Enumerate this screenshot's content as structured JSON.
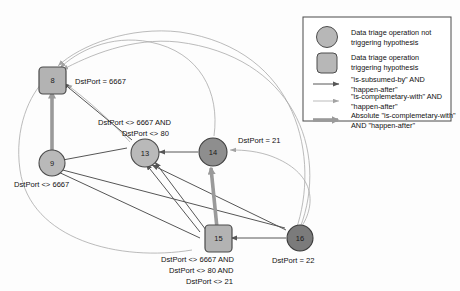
{
  "diagram": {
    "nodes": [
      {
        "id": "8",
        "shape": "square",
        "label": "8",
        "condition": "DstPort = 6667",
        "fill": "#b3b3b3"
      },
      {
        "id": "9",
        "shape": "circle",
        "label": "9",
        "condition": "DstPort <> 6667",
        "fill": "#b9b9b9"
      },
      {
        "id": "13",
        "shape": "circle",
        "label": "13",
        "condition": "DstPort <> 6667 AND\nDstPort <>  80",
        "fill": "#b9b9b9"
      },
      {
        "id": "14",
        "shape": "circle",
        "label": "14",
        "condition": "DstPort = 21",
        "fill": "#8e8e8e"
      },
      {
        "id": "15",
        "shape": "square",
        "label": "15",
        "condition": "DstPort <> 6667 AND\nDstPort <>  80 AND\nDstPort <> 21",
        "fill": "#b3b3b3"
      },
      {
        "id": "16",
        "shape": "circle",
        "label": "16",
        "condition": "DstPort = 22",
        "fill": "#7b7b7b"
      }
    ],
    "conditions": {
      "n8": "DstPort = 6667",
      "n9": "DstPort <> 6667",
      "n13_line1": "DstPort <> 6667 AND",
      "n13_line2": "DstPort <>  80",
      "n14": "DstPort = 21",
      "n15_line1": "DstPort <> 6667 AND",
      "n15_line2": "DstPort <>  80 AND",
      "n15_line3": "DstPort <> 21",
      "n16": "DstPort = 22"
    },
    "node_labels": {
      "n8": "8",
      "n9": "9",
      "n13": "13",
      "n14": "14",
      "n15": "15",
      "n16": "16"
    }
  },
  "legend": {
    "items": [
      {
        "symbol": "circle",
        "line1": "Data triage operation not",
        "line2": "triggering hypothesis"
      },
      {
        "symbol": "square",
        "line1": "Data triage operation",
        "line2": "triggering hypothesis"
      },
      {
        "symbol": "arrow-dark",
        "line1": "\"is-subsumed-by\" AND",
        "line2": "\"happen-after\""
      },
      {
        "symbol": "arrow-light",
        "line1": "\"is-complemetary-with\" AND",
        "line2": "\"happen-after\""
      },
      {
        "symbol": "arrow-thick",
        "line1": "Absolute \"is-complemetary-with\"",
        "line2": "AND \"happen-after\""
      }
    ],
    "l1a": "Data triage operation not",
    "l1b": "triggering hypothesis",
    "l2a": "Data triage operation",
    "l2b": "triggering hypothesis",
    "l3a": "\"is-subsumed-by\" AND",
    "l3b": "\"happen-after\"",
    "l4a": "\"is-complemetary-with\" AND",
    "l4b": "\"happen-after\"",
    "l5a": "Absolute \"is-complemetary-with\"",
    "l5b": "AND \"happen-after\""
  },
  "colors": {
    "edge_dark": "#565656",
    "edge_light": "#a9a9a9",
    "edge_thick": "#9a9a9a",
    "node_light": "#b9b9b9",
    "node_dark": "#8e8e8e",
    "node_darker": "#7b7b7b",
    "background": "#fdfdfd"
  }
}
